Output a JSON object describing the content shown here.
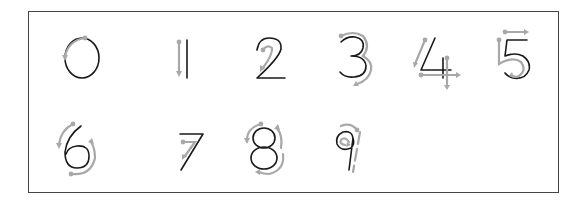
{
  "worksheet": {
    "title": "Number writing practice",
    "colors": {
      "digit": "#1a1a1a",
      "guide": "#a8a8a8",
      "border": "#444444"
    },
    "digits": [
      {
        "value": "0",
        "guide": "counter-clockwise arc starting at top"
      },
      {
        "value": "1",
        "guide": "straight down"
      },
      {
        "value": "2",
        "guide": "curve then diagonal down-left"
      },
      {
        "value": "3",
        "guide": "two curves downward"
      },
      {
        "value": "4",
        "guide": "diagonal down, cross stroke right, vertical down"
      },
      {
        "value": "5",
        "guide": "down, curve around, top bar right"
      },
      {
        "value": "6",
        "guide": "curve down and loop around"
      },
      {
        "value": "7",
        "guide": "across then diagonal down"
      },
      {
        "value": "8",
        "guide": "S-curve then back up"
      },
      {
        "value": "9",
        "guide": "loop counter-clockwise then straight down"
      }
    ]
  }
}
